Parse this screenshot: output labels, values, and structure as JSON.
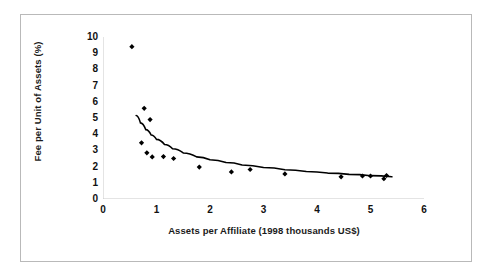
{
  "chart_data": {
    "type": "scatter",
    "title": "",
    "xlabel": "Assets per Affiliate (1998 thousands US$)",
    "ylabel": "Fee per Unit of Assets (%)",
    "xlim": [
      0,
      6
    ],
    "ylim": [
      0,
      10
    ],
    "x_ticks": [
      0,
      1,
      2,
      3,
      4,
      5,
      6
    ],
    "y_ticks": [
      0,
      1,
      2,
      3,
      4,
      5,
      6,
      7,
      8,
      9,
      10
    ],
    "x_tick_labels": [
      "0",
      "1",
      "2",
      "3",
      "4",
      "5",
      "6"
    ],
    "y_tick_labels": [
      "0",
      "1",
      "2",
      "3",
      "4",
      "5",
      "6",
      "7",
      "8",
      "9",
      "10"
    ],
    "grid": false,
    "legend": false,
    "marker": "diamond",
    "marker_color": "#000000",
    "series": [
      {
        "name": "Affiliates",
        "type": "scatter",
        "points": [
          {
            "x": 0.54,
            "y": 9.4
          },
          {
            "x": 0.77,
            "y": 5.6
          },
          {
            "x": 0.88,
            "y": 4.9
          },
          {
            "x": 0.72,
            "y": 3.47
          },
          {
            "x": 0.82,
            "y": 2.85
          },
          {
            "x": 0.92,
            "y": 2.6
          },
          {
            "x": 1.13,
            "y": 2.62
          },
          {
            "x": 1.32,
            "y": 2.5
          },
          {
            "x": 1.8,
            "y": 1.97
          },
          {
            "x": 2.4,
            "y": 1.67
          },
          {
            "x": 2.75,
            "y": 1.82
          },
          {
            "x": 3.4,
            "y": 1.55
          },
          {
            "x": 4.45,
            "y": 1.37
          },
          {
            "x": 4.85,
            "y": 1.42
          },
          {
            "x": 5.0,
            "y": 1.42
          },
          {
            "x": 5.25,
            "y": 1.25
          },
          {
            "x": 5.3,
            "y": 1.45
          }
        ]
      },
      {
        "name": "Fitted trend curve",
        "type": "line",
        "line_color": "#000000",
        "points": [
          {
            "x": 0.62,
            "y": 5.15
          },
          {
            "x": 0.7,
            "y": 4.7
          },
          {
            "x": 0.8,
            "y": 4.28
          },
          {
            "x": 0.9,
            "y": 3.95
          },
          {
            "x": 1.0,
            "y": 3.68
          },
          {
            "x": 1.15,
            "y": 3.36
          },
          {
            "x": 1.3,
            "y": 3.1
          },
          {
            "x": 1.5,
            "y": 2.84
          },
          {
            "x": 1.75,
            "y": 2.6
          },
          {
            "x": 2.0,
            "y": 2.42
          },
          {
            "x": 2.3,
            "y": 2.25
          },
          {
            "x": 2.6,
            "y": 2.1
          },
          {
            "x": 3.0,
            "y": 1.94
          },
          {
            "x": 3.4,
            "y": 1.81
          },
          {
            "x": 3.8,
            "y": 1.7
          },
          {
            "x": 4.2,
            "y": 1.6
          },
          {
            "x": 4.6,
            "y": 1.52
          },
          {
            "x": 5.0,
            "y": 1.44
          },
          {
            "x": 5.4,
            "y": 1.37
          }
        ]
      }
    ]
  }
}
